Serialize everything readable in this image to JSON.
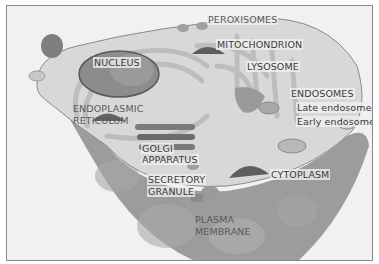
{
  "diagram": {
    "labels": {
      "peroxisomes": "PEROXISOMES",
      "mitochondrion": "MITOCHONDRION",
      "nucleus": "NUCLEUS",
      "lysosome": "LYSOSOME",
      "endosomes": "ENDOSOMES",
      "late_endosome": "Late endosome",
      "early_endosome": "Early endosome",
      "er_line1": "ENDOPLASMIC",
      "er_line2": "RETICULUM",
      "golgi_line1": "GOLGI",
      "golgi_line2": "APPARATUS",
      "secretory_line1": "SECRETORY",
      "secretory_line2": "GRANULE",
      "cytoplasm": "CYTOPLASM",
      "plasma_line1": "PLASMA",
      "plasma_line2": "MEMBRANE"
    },
    "colors": {
      "background": "#f1f1f1",
      "cytoplasm": "#d4d4d4",
      "membrane_outer": "#9a9a9a",
      "nucleus": "#8c8c8c",
      "organelle_dark": "#6a6a6a",
      "label_text": "#3a3a3a"
    }
  }
}
